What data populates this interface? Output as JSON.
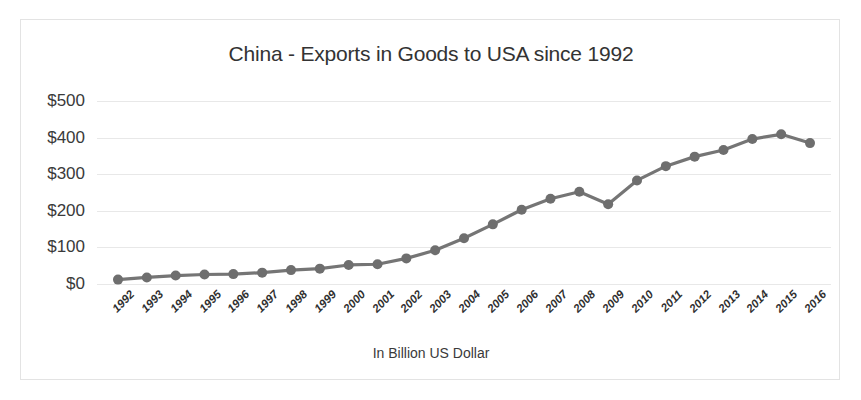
{
  "chart_data": {
    "type": "line",
    "title": "China - Exports in Goods to USA since 1992",
    "xlabel": "In Billion US Dollar",
    "ylabel": "",
    "categories": [
      "1992",
      "1993",
      "1994",
      "1995",
      "1996",
      "1997",
      "1998",
      "1999",
      "2000",
      "2001",
      "2002",
      "2003",
      "2004",
      "2005",
      "2006",
      "2007",
      "2008",
      "2009",
      "2010",
      "2011",
      "2012",
      "2013",
      "2014",
      "2015",
      "2016"
    ],
    "values": [
      12,
      18,
      23,
      26,
      27,
      31,
      38,
      42,
      52,
      54,
      70,
      92,
      125,
      163,
      203,
      233,
      252,
      218,
      283,
      322,
      348,
      366,
      396,
      409,
      385
    ],
    "series": [
      {
        "name": "Exports in Goods to USA",
        "values": [
          12,
          18,
          23,
          26,
          27,
          31,
          38,
          42,
          52,
          54,
          70,
          92,
          125,
          163,
          203,
          233,
          252,
          218,
          283,
          322,
          348,
          366,
          396,
          409,
          385
        ]
      }
    ],
    "ylim": [
      0,
      500
    ],
    "ytick_labels": [
      "$0",
      "$100",
      "$200",
      "$300",
      "$400",
      "$500"
    ],
    "ytick_values": [
      0,
      100,
      200,
      300,
      400,
      500
    ],
    "grid": true,
    "legend": "none",
    "line_color": "#757575",
    "marker_color": "#6e6e6e",
    "grid_color": "#e8e8e8",
    "border_color": "#e3e3e3",
    "background_color": "#ffffff"
  }
}
